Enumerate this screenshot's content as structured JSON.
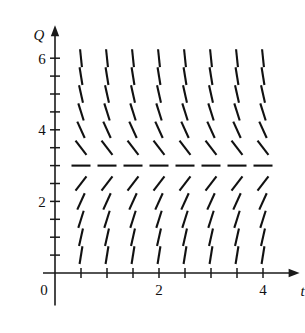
{
  "figure": {
    "kind": "slope-field",
    "background_color": "#ffffff",
    "ink_color": "#111111"
  },
  "axes": {
    "x": {
      "name": "t",
      "label_text": "t",
      "origin_label": "0",
      "range": [
        0,
        4.55
      ],
      "tick_step": 0.5,
      "tick_values": [
        0.5,
        1,
        1.5,
        2,
        2.5,
        3,
        3.5,
        4
      ],
      "labeled_ticks": [
        {
          "value": 2,
          "text": "2"
        },
        {
          "value": 4,
          "text": "4"
        }
      ],
      "has_arrow": true
    },
    "y": {
      "name": "Q",
      "label_text": "Q",
      "range": [
        -0.35,
        6.7
      ],
      "tick_step": 0.5,
      "tick_values": [
        0.5,
        1,
        1.5,
        2,
        2.5,
        3,
        3.5,
        4,
        4.5,
        5,
        5.5,
        6
      ],
      "labeled_ticks": [
        {
          "value": 2,
          "text": "2"
        },
        {
          "value": 4,
          "text": "4"
        },
        {
          "value": 6,
          "text": "6"
        }
      ],
      "has_arrow": true
    }
  },
  "chart_data": {
    "type": "scatter",
    "title": "",
    "xlabel": "t",
    "ylabel": "Q",
    "xlim": [
      0,
      4.55
    ],
    "ylim": [
      -0.35,
      6.7
    ],
    "grid": false,
    "legend": "none",
    "equilibrium_Q": 3,
    "t_values": [
      0.5,
      1,
      1.5,
      2,
      2.5,
      3,
      3.5,
      4
    ],
    "Q_values": [
      0.5,
      1,
      1.5,
      2,
      2.5,
      3,
      3.5,
      4,
      4.5,
      5,
      5.5,
      6
    ],
    "slope_rule": "dQ/dt depends only on Q; slope is 0 at Q = 3, positive for Q < 3, negative for Q > 3",
    "slopes_by_Q": [
      {
        "Q": 0.5,
        "slope": 9.0
      },
      {
        "Q": 1,
        "slope": 6.5
      },
      {
        "Q": 1.5,
        "slope": 4.6
      },
      {
        "Q": 2,
        "slope": 3.2
      },
      {
        "Q": 2.5,
        "slope": 1.9
      },
      {
        "Q": 3,
        "slope": 0.0
      },
      {
        "Q": 3.5,
        "slope": -1.9
      },
      {
        "Q": 4,
        "slope": -3.2
      },
      {
        "Q": 4.5,
        "slope": -4.6
      },
      {
        "Q": 5,
        "slope": -6.5
      },
      {
        "Q": 5.5,
        "slope": -9.0
      },
      {
        "Q": 6,
        "slope": -14.0
      }
    ]
  }
}
